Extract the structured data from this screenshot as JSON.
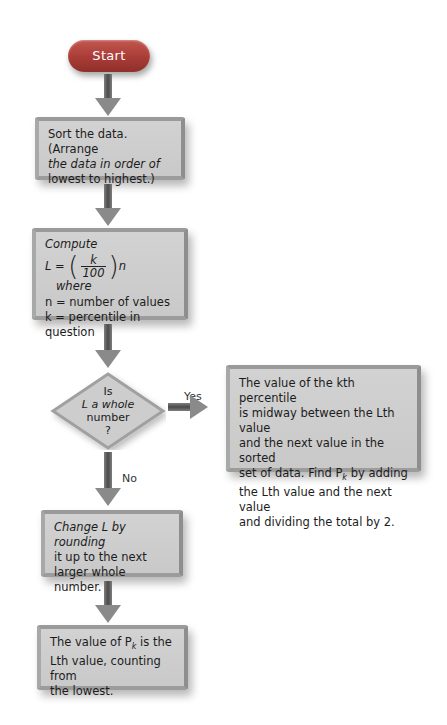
{
  "flowchart": {
    "start": {
      "label": "Start",
      "color": "#a93c36"
    },
    "step_sort": {
      "lines": [
        "Sort the data. (Arrange",
        "the data in order of",
        "lowest to highest.)"
      ]
    },
    "step_compute": {
      "title": "Compute",
      "formula_lhs": "L =",
      "formula_num": "k",
      "formula_den": "100",
      "formula_var": "n",
      "formula_where": "where",
      "def_n": "n = number of values",
      "def_k": "k = percentile in question"
    },
    "decision": {
      "lines": [
        "Is",
        "L a whole",
        "number",
        "?"
      ]
    },
    "branch_yes": {
      "label": "Yes",
      "lines": [
        "The value of the kth percentile",
        "is midway between the Lth value",
        "and the next value in the sorted",
        "set of data. Find P",
        "k",
        " by adding",
        "the Lth value and the next value",
        "and dividing the total by 2."
      ]
    },
    "branch_no": {
      "label": "No"
    },
    "step_round": {
      "lines": [
        "Change L by rounding",
        "it up to the next",
        "larger whole number."
      ]
    },
    "step_result": {
      "line1_pre": "The value of P",
      "line1_sub": "k",
      "line1_post": " is the",
      "line2": "Lth value, counting from",
      "line3": "the lowest."
    },
    "colors": {
      "box_fill": "#cfcfcf",
      "box_border": "#999999",
      "arrow": "#6e6e6e"
    }
  }
}
